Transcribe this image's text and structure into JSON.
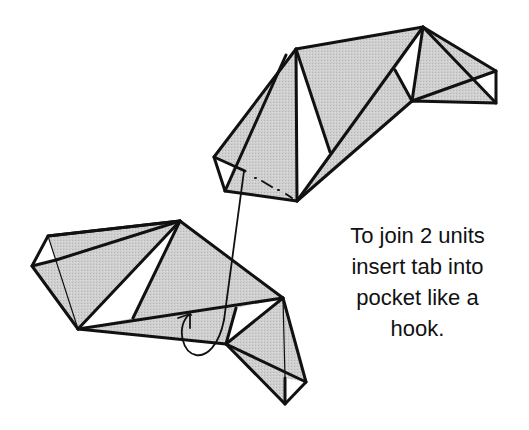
{
  "diagram": {
    "colors": {
      "paper_fill": "#c8c8c8",
      "white_fill": "#ffffff",
      "stroke": "#111111"
    },
    "units": [
      {
        "name": "upper-unit",
        "role": "pocket unit"
      },
      {
        "name": "lower-unit",
        "role": "tab unit"
      }
    ],
    "arrow": {
      "name": "insertion-arrow",
      "meaning": "insert tab into pocket like a hook"
    },
    "caption": {
      "lines": [
        "To join 2 units",
        "insert tab into",
        "pocket like a",
        "hook."
      ]
    }
  }
}
